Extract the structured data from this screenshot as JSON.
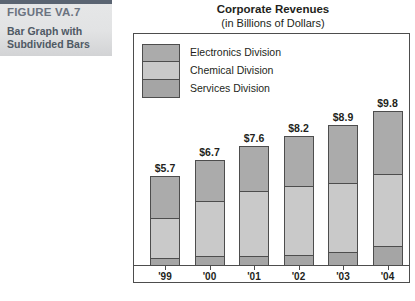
{
  "figure": {
    "number": "FIGURE VA.7",
    "caption": "Bar Graph with Subdivided Bars"
  },
  "chart_data": {
    "type": "bar",
    "subtype": "stacked",
    "title": "Corporate Revenues",
    "subtitle": "(in Billions of Dollars)",
    "xlabel": "",
    "ylabel": "",
    "unit": "Billions of Dollars",
    "grid": false,
    "legend_position": "top-left-inside",
    "ylim": [
      0,
      9.8
    ],
    "categories": [
      "'99",
      "'00",
      "'01",
      "'02",
      "'03",
      "'04"
    ],
    "totals": [
      5.7,
      6.7,
      7.6,
      8.2,
      8.9,
      9.8
    ],
    "data_labels": [
      "$5.7",
      "$6.7",
      "$7.6",
      "$8.2",
      "$8.9",
      "$9.8"
    ],
    "series": [
      {
        "name": "Electronics Division",
        "color": "#ababab",
        "values": [
          2.7,
          2.6,
          2.9,
          3.2,
          3.7,
          4.0
        ]
      },
      {
        "name": "Chemical Division",
        "color": "#c9c9c9",
        "values": [
          2.6,
          3.6,
          4.2,
          4.4,
          4.4,
          4.6
        ]
      },
      {
        "name": "Services Division",
        "color": "#a5a5a5",
        "values": [
          0.4,
          0.5,
          0.5,
          0.6,
          0.8,
          1.2
        ]
      }
    ]
  },
  "legend": {
    "items": [
      {
        "label": "Electronics Division"
      },
      {
        "label": "Chemical Division"
      },
      {
        "label": "Services Division"
      }
    ]
  },
  "colors": {
    "banner_rule": "#5a6472",
    "banner_text": "#6b7380",
    "frame": "#4d4d4d",
    "electronics": "#ababab",
    "chemical": "#c9c9c9",
    "services": "#a5a5a5"
  }
}
